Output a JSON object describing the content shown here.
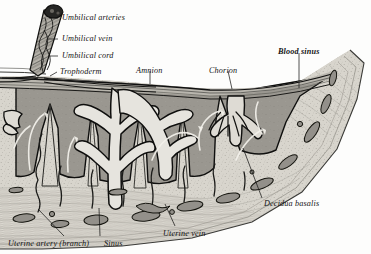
{
  "figure": {
    "style": "engraving",
    "background_color": "#fdfdfc"
  },
  "palette": {
    "ink": "#101010",
    "decidua_fill": "#d8d5cd",
    "sinus_fill": "#9a9790",
    "chorion_fill": "#b9b6ae",
    "villus_fill": "#e6e4de",
    "vessel_fill": "#8f8c85",
    "flow_arrow": "#f4f2ec",
    "cord_dark": "#2a2a28"
  },
  "labels": [
    {
      "id": "umbilical-arteries",
      "text": "Umbilical arteries",
      "x": 62,
      "y": 14,
      "bold": false
    },
    {
      "id": "umbilical-vein",
      "text": "Umbilical vein",
      "x": 62,
      "y": 35,
      "bold": false
    },
    {
      "id": "umbilical-cord",
      "text": "Umbilical cord",
      "x": 62,
      "y": 52,
      "bold": false
    },
    {
      "id": "trophoderm",
      "text": "Trophoderm",
      "x": 60,
      "y": 68,
      "bold": false
    },
    {
      "id": "amnion",
      "text": "Amnion",
      "x": 136,
      "y": 67,
      "bold": false
    },
    {
      "id": "chorion",
      "text": "Chorion",
      "x": 209,
      "y": 67,
      "bold": false
    },
    {
      "id": "blood-sinus",
      "text": "Blood sinus",
      "x": 278,
      "y": 48,
      "bold": true
    },
    {
      "id": "decidua-basalis",
      "text": "Decidua basalis",
      "x": 264,
      "y": 200,
      "bold": false
    },
    {
      "id": "uterine-vein",
      "text": "Uterine vein",
      "x": 163,
      "y": 230,
      "bold": false
    },
    {
      "id": "uterine-artery",
      "text": "Uterine artery (branch)",
      "x": 8,
      "y": 240,
      "bold": false
    },
    {
      "id": "sinus",
      "text": "Sinus",
      "x": 104,
      "y": 240,
      "bold": false
    }
  ],
  "leader_lines": [
    {
      "id": "leader-umbilical-arteries",
      "x1": 58,
      "y1": 18,
      "x2": 49,
      "y2": 18
    },
    {
      "id": "leader-umbilical-vein",
      "x1": 58,
      "y1": 39,
      "x2": 48,
      "y2": 39
    },
    {
      "id": "leader-umbilical-cord",
      "x1": 58,
      "y1": 56,
      "x2": 48,
      "y2": 56
    },
    {
      "id": "leader-trophoderm",
      "x1": 57,
      "y1": 72,
      "x2": 50,
      "y2": 76
    },
    {
      "id": "leader-amnion",
      "x1": 150,
      "y1": 71,
      "x2": 150,
      "y2": 84
    },
    {
      "id": "leader-chorion",
      "x1": 228,
      "y1": 71,
      "x2": 232,
      "y2": 89
    },
    {
      "id": "leader-blood-sinus",
      "x1": 299,
      "y1": 53,
      "x2": 299,
      "y2": 88
    },
    {
      "id": "leader-decidua-basalis",
      "x1": 262,
      "y1": 198,
      "x2": 243,
      "y2": 148
    },
    {
      "id": "leader-uterine-vein",
      "x1": 175,
      "y1": 226,
      "x2": 165,
      "y2": 204
    },
    {
      "id": "leader-uterine-artery",
      "x1": 64,
      "y1": 236,
      "x2": 38,
      "y2": 209
    },
    {
      "id": "leader-sinus",
      "x1": 100,
      "y1": 236,
      "x2": 99,
      "y2": 208
    }
  ],
  "anatomy": {
    "structures": [
      "umbilical cord (twisted, containing two umbilical arteries and one umbilical vein)",
      "amnion membrane",
      "chorion membrane",
      "trophoderm layer",
      "chorionic villus trees (three groups)",
      "intervillous blood sinuses",
      "decidual septa",
      "decidua basalis",
      "myometrium with uterine arteries, veins and sinuses"
    ],
    "flow_arrow_count": 6,
    "villus_tree_count": 3,
    "septa_count": 4,
    "uterine_vessel_count": 16
  }
}
